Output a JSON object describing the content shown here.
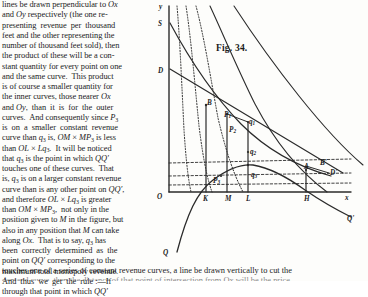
{
  "document": {
    "figure_caption": "Fig. 34.",
    "left_column_lines": [
      "lines be drawn perpendicular to Ox",
      "and Oy respectively (the one re-",
      "presenting revenue per thousand",
      "feet and the other representing the",
      "number of thousand feet sold), then",
      "the product of these will be a con-",
      "stant quantity for every point on one",
      "and the same curve.  This product",
      "is of course a smaller quantity for",
      "the inner curves, those nearer Ox",
      "and Oy, than it is for the outer",
      "curves.  And consequently since P3",
      "is on a smaller constant revenue",
      "curve than q3 is, OM × MP3 is less",
      "than OL × Lq3.  It will be noticed",
      "that q3 is the point in which QQ'",
      "touches one of these curves.  That",
      "is, q3 is on a larger constant revenue",
      "curve than is any other point on QQ',",
      "and therefore OL × Lq3 is greater",
      "than OM × MP3, not only in the",
      "position given to M in the figure, but",
      "also in any position that M can take",
      "along Ox.  That is to say, q3 has",
      "been correctly determined as the",
      "point on QQ' corresponding to the",
      "maximum total monopoly revenue.",
      "And thus we get the rule :—If",
      "through that point in which QQ'"
    ],
    "bottom_wide_line": "touches one of a series of constant revenue curves, a line be drawn vertically to cut the",
    "bottom_clipped_line": "demand curve, then the distance of that point of intersection from Ox will be the price"
  },
  "chart_data": {
    "type": "line",
    "title": "Fig. 34.",
    "axes": {
      "origin_label": "O",
      "y_axis_label": "y",
      "x_axis_label": "x"
    },
    "point_labels": [
      {
        "text": "y",
        "sub": "",
        "x": 4,
        "y": 4,
        "name": "y-axis-label"
      },
      {
        "text": "S",
        "sub": "",
        "x": 3,
        "y": 21,
        "name": "supply-curve-label-S"
      },
      {
        "text": "D",
        "sub": "",
        "x": 3,
        "y": 68,
        "name": "demand-curve-label-D"
      },
      {
        "text": "O",
        "sub": "",
        "x": 2,
        "y": 194,
        "name": "origin-label-O"
      },
      {
        "text": "B",
        "sub": "",
        "x": 52,
        "y": 100,
        "name": "point-label-B"
      },
      {
        "text": "P",
        "sub": "1",
        "x": 69,
        "y": 112,
        "name": "point-label-P1"
      },
      {
        "text": "P",
        "sub": "2",
        "x": 74,
        "y": 127,
        "name": "point-label-P2"
      },
      {
        "text": "q",
        "sub": "1",
        "x": 94,
        "y": 119,
        "name": "point-label-q1"
      },
      {
        "text": "q",
        "sub": "2",
        "x": 95,
        "y": 149,
        "name": "point-label-q2"
      },
      {
        "text": "q",
        "sub": "3",
        "x": 96,
        "y": 172,
        "name": "point-label-q3"
      },
      {
        "text": "P",
        "sub": "3",
        "x": 58,
        "y": 178,
        "name": "point-label-P3"
      },
      {
        "text": "A",
        "sub": "",
        "x": 149,
        "y": 164,
        "name": "point-label-A"
      },
      {
        "text": "B'",
        "sub": "",
        "x": 165,
        "y": 160,
        "name": "point-label-B-prime"
      },
      {
        "text": "D'",
        "sub": "",
        "x": 175,
        "y": 170,
        "name": "point-label-D-prime"
      },
      {
        "text": "K",
        "sub": "",
        "x": 48,
        "y": 196,
        "name": "x-tick-label-K"
      },
      {
        "text": "M",
        "sub": "",
        "x": 70,
        "y": 196,
        "name": "x-tick-label-M"
      },
      {
        "text": "L",
        "sub": "",
        "x": 91,
        "y": 196,
        "name": "x-tick-label-L"
      },
      {
        "text": "H",
        "sub": "",
        "x": 149,
        "y": 196,
        "name": "x-tick-label-H"
      },
      {
        "text": "x",
        "sub": "",
        "x": 190,
        "y": 195,
        "name": "x-axis-label"
      },
      {
        "text": "Q'",
        "sub": "",
        "x": 192,
        "y": 216,
        "name": "curve-label-Q-prime"
      },
      {
        "text": "Q",
        "sub": "",
        "x": 8,
        "y": 250,
        "name": "curve-label-Q"
      }
    ],
    "series": [
      {
        "name": "constant-revenue-curve-1",
        "style": "dotted"
      },
      {
        "name": "constant-revenue-curve-2",
        "style": "dotted"
      },
      {
        "name": "constant-revenue-curve-3",
        "style": "dotted"
      },
      {
        "name": "constant-revenue-curve-4",
        "style": "solid"
      },
      {
        "name": "constant-revenue-curve-5",
        "style": "solid"
      },
      {
        "name": "demand-curve-DD",
        "style": "solid"
      },
      {
        "name": "supply-curve-SS",
        "style": "solid"
      },
      {
        "name": "total-revenue-curve-QQ",
        "style": "solid"
      }
    ],
    "colors": {
      "ink": "#2b2b2b",
      "paper": "#fdfdfb"
    }
  }
}
